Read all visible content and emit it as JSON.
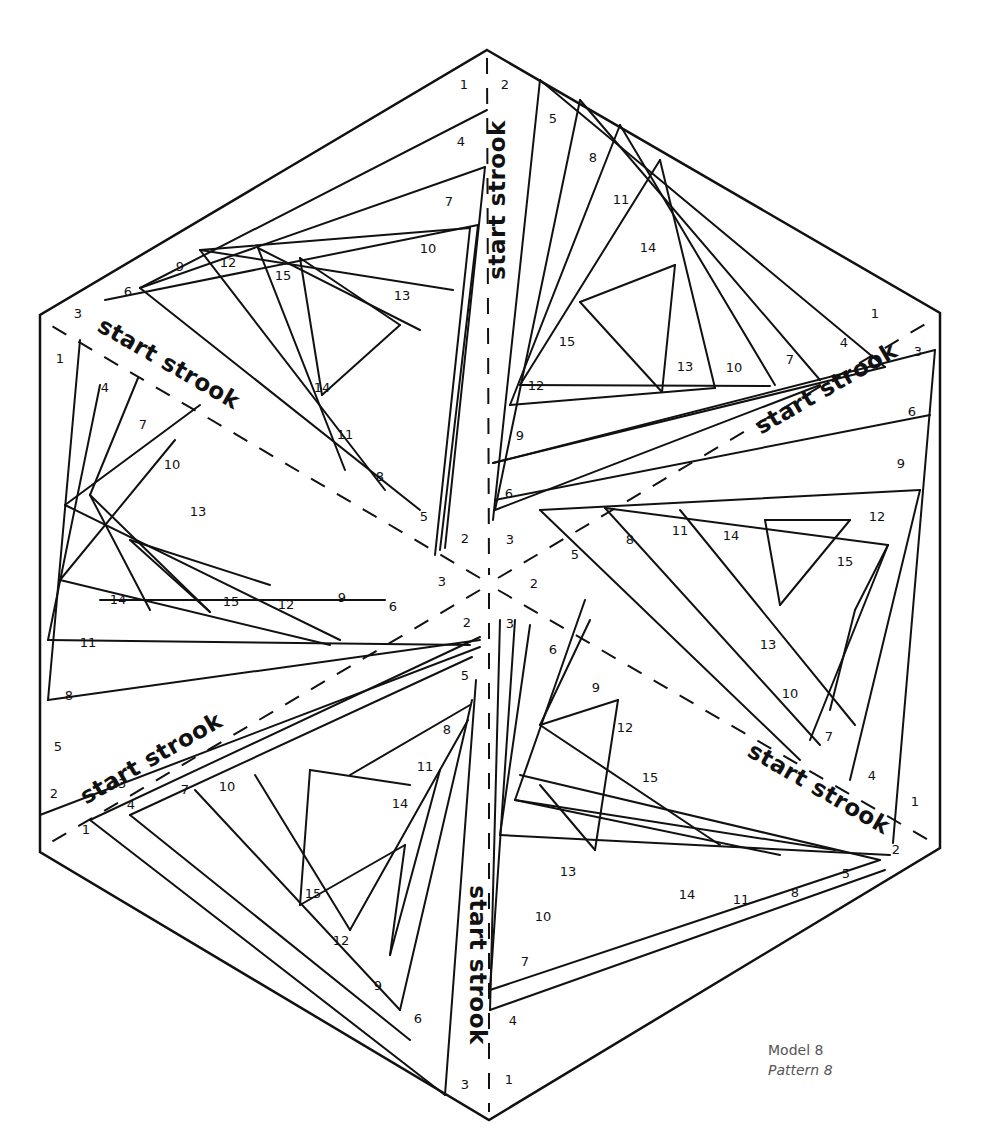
{
  "caption": {
    "model": "Model 8",
    "pattern": "Pattern 8"
  },
  "colors": {
    "line": "#111111",
    "caption": "#555555",
    "background": "#ffffff"
  },
  "hexagon": [
    [
      487,
      50
    ],
    [
      940,
      313
    ],
    [
      940,
      848
    ],
    [
      489,
      1120
    ],
    [
      40,
      852
    ],
    [
      40,
      315
    ]
  ],
  "center": [
    489,
    584
  ],
  "dividers": [
    [
      [
        487,
        58
      ],
      [
        489,
        575
      ]
    ],
    [
      [
        489,
        593
      ],
      [
        489,
        1112
      ]
    ],
    [
      [
        480,
        578
      ],
      [
        50,
        325
      ]
    ],
    [
      [
        498,
        578
      ],
      [
        932,
        320
      ]
    ],
    [
      [
        480,
        590
      ],
      [
        48,
        844
      ]
    ],
    [
      [
        498,
        590
      ],
      [
        932,
        842
      ]
    ]
  ],
  "strips": [
    {
      "label": "start strook",
      "x": 505,
      "y": 200,
      "rotate": -90
    },
    {
      "label": "start strook",
      "x": 165,
      "y": 370,
      "rotate": 30
    },
    {
      "label": "start strook",
      "x": 830,
      "y": 395,
      "rotate": -30
    },
    {
      "label": "start strook",
      "x": 155,
      "y": 765,
      "rotate": -30
    },
    {
      "label": "start strook",
      "x": 815,
      "y": 795,
      "rotate": 30
    },
    {
      "label": "start strook",
      "x": 470,
      "y": 965,
      "rotate": 90
    }
  ],
  "lines": [
    [
      [
        140,
        288
      ],
      [
        487,
        110
      ]
    ],
    [
      [
        140,
        288
      ],
      [
        485,
        167
      ]
    ],
    [
      [
        105,
        300
      ],
      [
        478,
        225
      ]
    ],
    [
      [
        200,
        250
      ],
      [
        470,
        228
      ]
    ],
    [
      [
        200,
        250
      ],
      [
        453,
        290
      ]
    ],
    [
      [
        258,
        248
      ],
      [
        420,
        330
      ]
    ],
    [
      [
        300,
        258
      ],
      [
        400,
        325
      ]
    ],
    [
      [
        300,
        258
      ],
      [
        322,
        395
      ]
    ],
    [
      [
        322,
        395
      ],
      [
        400,
        325
      ]
    ],
    [
      [
        258,
        248
      ],
      [
        345,
        470
      ]
    ],
    [
      [
        200,
        250
      ],
      [
        385,
        490
      ]
    ],
    [
      [
        140,
        288
      ],
      [
        420,
        510
      ]
    ],
    [
      [
        470,
        228
      ],
      [
        435,
        555
      ]
    ],
    [
      [
        478,
        225
      ],
      [
        440,
        550
      ]
    ],
    [
      [
        485,
        167
      ],
      [
        445,
        548
      ]
    ],
    [
      [
        540,
        80
      ],
      [
        493,
        520
      ]
    ],
    [
      [
        580,
        100
      ],
      [
        495,
        510
      ]
    ],
    [
      [
        620,
        125
      ],
      [
        510,
        405
      ]
    ],
    [
      [
        660,
        160
      ],
      [
        520,
        385
      ]
    ],
    [
      [
        660,
        160
      ],
      [
        715,
        388
      ]
    ],
    [
      [
        620,
        125
      ],
      [
        775,
        385
      ]
    ],
    [
      [
        580,
        100
      ],
      [
        820,
        380
      ]
    ],
    [
      [
        540,
        80
      ],
      [
        885,
        367
      ]
    ],
    [
      [
        675,
        265
      ],
      [
        580,
        302
      ]
    ],
    [
      [
        675,
        265
      ],
      [
        662,
        392
      ]
    ],
    [
      [
        580,
        302
      ],
      [
        662,
        392
      ]
    ],
    [
      [
        510,
        405
      ],
      [
        715,
        388
      ]
    ],
    [
      [
        520,
        385
      ],
      [
        770,
        386
      ]
    ],
    [
      [
        495,
        510
      ],
      [
        820,
        385
      ]
    ],
    [
      [
        493,
        463
      ],
      [
        885,
        367
      ]
    ],
    [
      [
        935,
        350
      ],
      [
        493,
        463
      ]
    ],
    [
      [
        930,
        415
      ],
      [
        495,
        500
      ]
    ],
    [
      [
        920,
        490
      ],
      [
        540,
        510
      ]
    ],
    [
      [
        888,
        545
      ],
      [
        605,
        508
      ]
    ],
    [
      [
        888,
        545
      ],
      [
        855,
        610
      ]
    ],
    [
      [
        850,
        520
      ],
      [
        780,
        605
      ]
    ],
    [
      [
        850,
        520
      ],
      [
        765,
        520
      ]
    ],
    [
      [
        765,
        520
      ],
      [
        780,
        605
      ]
    ],
    [
      [
        855,
        610
      ],
      [
        830,
        710
      ]
    ],
    [
      [
        888,
        545
      ],
      [
        810,
        740
      ]
    ],
    [
      [
        920,
        490
      ],
      [
        850,
        780
      ]
    ],
    [
      [
        935,
        350
      ],
      [
        893,
        843
      ]
    ],
    [
      [
        540,
        510
      ],
      [
        800,
        760
      ]
    ],
    [
      [
        605,
        508
      ],
      [
        820,
        745
      ]
    ],
    [
      [
        680,
        510
      ],
      [
        855,
        725
      ]
    ],
    [
      [
        40,
        815
      ],
      [
        480,
        647
      ]
    ],
    [
      [
        48,
        700
      ],
      [
        480,
        640
      ]
    ],
    [
      [
        48,
        640
      ],
      [
        470,
        645
      ]
    ],
    [
      [
        65,
        505
      ],
      [
        340,
        640
      ]
    ],
    [
      [
        60,
        580
      ],
      [
        330,
        645
      ]
    ],
    [
      [
        90,
        495
      ],
      [
        150,
        610
      ]
    ],
    [
      [
        90,
        495
      ],
      [
        210,
        612
      ]
    ],
    [
      [
        130,
        540
      ],
      [
        210,
        612
      ]
    ],
    [
      [
        130,
        540
      ],
      [
        270,
        585
      ]
    ],
    [
      [
        100,
        600
      ],
      [
        385,
        600
      ]
    ],
    [
      [
        90,
        495
      ],
      [
        138,
        378
      ]
    ],
    [
      [
        48,
        640
      ],
      [
        100,
        385
      ]
    ],
    [
      [
        48,
        700
      ],
      [
        80,
        340
      ]
    ],
    [
      [
        65,
        505
      ],
      [
        200,
        405
      ]
    ],
    [
      [
        60,
        580
      ],
      [
        175,
        440
      ]
    ],
    [
      [
        90,
        820
      ],
      [
        480,
        637
      ]
    ],
    [
      [
        90,
        820
      ],
      [
        445,
        1095
      ]
    ],
    [
      [
        130,
        815
      ],
      [
        472,
        657
      ]
    ],
    [
      [
        130,
        815
      ],
      [
        410,
        1040
      ]
    ],
    [
      [
        195,
        790
      ],
      [
        400,
        1010
      ]
    ],
    [
      [
        255,
        775
      ],
      [
        350,
        930
      ]
    ],
    [
      [
        310,
        770
      ],
      [
        410,
        785
      ]
    ],
    [
      [
        310,
        770
      ],
      [
        300,
        905
      ]
    ],
    [
      [
        300,
        905
      ],
      [
        405,
        845
      ]
    ],
    [
      [
        405,
        845
      ],
      [
        390,
        955
      ]
    ],
    [
      [
        440,
        770
      ],
      [
        390,
        955
      ]
    ],
    [
      [
        468,
        720
      ],
      [
        350,
        930
      ]
    ],
    [
      [
        472,
        700
      ],
      [
        400,
        1010
      ]
    ],
    [
      [
        476,
        680
      ],
      [
        445,
        1095
      ]
    ],
    [
      [
        350,
        775
      ],
      [
        470,
        705
      ]
    ],
    [
      [
        490,
        1010
      ],
      [
        885,
        870
      ]
    ],
    [
      [
        490,
        990
      ],
      [
        880,
        860
      ]
    ],
    [
      [
        500,
        835
      ],
      [
        890,
        855
      ]
    ],
    [
      [
        515,
        800
      ],
      [
        835,
        850
      ]
    ],
    [
      [
        515,
        800
      ],
      [
        780,
        855
      ]
    ],
    [
      [
        540,
        725
      ],
      [
        720,
        845
      ]
    ],
    [
      [
        540,
        725
      ],
      [
        618,
        700
      ]
    ],
    [
      [
        618,
        700
      ],
      [
        595,
        850
      ]
    ],
    [
      [
        540,
        785
      ],
      [
        595,
        850
      ]
    ],
    [
      [
        520,
        775
      ],
      [
        880,
        860
      ]
    ],
    [
      [
        590,
        620
      ],
      [
        540,
        725
      ]
    ],
    [
      [
        585,
        600
      ],
      [
        515,
        800
      ]
    ],
    [
      [
        530,
        625
      ],
      [
        500,
        835
      ]
    ],
    [
      [
        515,
        620
      ],
      [
        490,
        990
      ]
    ],
    [
      [
        500,
        620
      ],
      [
        490,
        1010
      ]
    ]
  ],
  "numbers": [
    {
      "t": "1",
      "x": 464,
      "y": 89
    },
    {
      "t": "4",
      "x": 461,
      "y": 146
    },
    {
      "t": "7",
      "x": 449,
      "y": 206
    },
    {
      "t": "10",
      "x": 428,
      "y": 253
    },
    {
      "t": "13",
      "x": 402,
      "y": 300
    },
    {
      "t": "15",
      "x": 283,
      "y": 280
    },
    {
      "t": "12",
      "x": 228,
      "y": 267
    },
    {
      "t": "9",
      "x": 180,
      "y": 271
    },
    {
      "t": "6",
      "x": 128,
      "y": 296
    },
    {
      "t": "3",
      "x": 78,
      "y": 318
    },
    {
      "t": "14",
      "x": 322,
      "y": 392
    },
    {
      "t": "11",
      "x": 345,
      "y": 439
    },
    {
      "t": "8",
      "x": 380,
      "y": 481
    },
    {
      "t": "5",
      "x": 424,
      "y": 521
    },
    {
      "t": "2",
      "x": 465,
      "y": 543
    },
    {
      "t": "1",
      "x": 60,
      "y": 363
    },
    {
      "t": "4",
      "x": 105,
      "y": 392
    },
    {
      "t": "7",
      "x": 143,
      "y": 429
    },
    {
      "t": "10",
      "x": 172,
      "y": 469
    },
    {
      "t": "13",
      "x": 198,
      "y": 516
    },
    {
      "t": "14",
      "x": 118,
      "y": 604
    },
    {
      "t": "11",
      "x": 88,
      "y": 647
    },
    {
      "t": "8",
      "x": 69,
      "y": 700
    },
    {
      "t": "5",
      "x": 58,
      "y": 751
    },
    {
      "t": "2",
      "x": 54,
      "y": 798
    },
    {
      "t": "15",
      "x": 231,
      "y": 606
    },
    {
      "t": "12",
      "x": 286,
      "y": 609
    },
    {
      "t": "9",
      "x": 342,
      "y": 602
    },
    {
      "t": "6",
      "x": 393,
      "y": 611
    },
    {
      "t": "3",
      "x": 442,
      "y": 586
    },
    {
      "t": "2",
      "x": 505,
      "y": 89
    },
    {
      "t": "5",
      "x": 553,
      "y": 123
    },
    {
      "t": "8",
      "x": 593,
      "y": 162
    },
    {
      "t": "11",
      "x": 621,
      "y": 204
    },
    {
      "t": "14",
      "x": 648,
      "y": 252
    },
    {
      "t": "15",
      "x": 567,
      "y": 346
    },
    {
      "t": "12",
      "x": 536,
      "y": 390
    },
    {
      "t": "9",
      "x": 520,
      "y": 440
    },
    {
      "t": "6",
      "x": 509,
      "y": 498
    },
    {
      "t": "3",
      "x": 510,
      "y": 544
    },
    {
      "t": "13",
      "x": 685,
      "y": 371
    },
    {
      "t": "10",
      "x": 734,
      "y": 372
    },
    {
      "t": "7",
      "x": 790,
      "y": 364
    },
    {
      "t": "4",
      "x": 844,
      "y": 347
    },
    {
      "t": "1",
      "x": 875,
      "y": 318
    },
    {
      "t": "3",
      "x": 918,
      "y": 356
    },
    {
      "t": "6",
      "x": 912,
      "y": 416
    },
    {
      "t": "9",
      "x": 901,
      "y": 468
    },
    {
      "t": "12",
      "x": 877,
      "y": 521
    },
    {
      "t": "15",
      "x": 845,
      "y": 566
    },
    {
      "t": "14",
      "x": 731,
      "y": 540
    },
    {
      "t": "11",
      "x": 680,
      "y": 535
    },
    {
      "t": "8",
      "x": 630,
      "y": 544
    },
    {
      "t": "5",
      "x": 575,
      "y": 559
    },
    {
      "t": "2",
      "x": 534,
      "y": 588
    },
    {
      "t": "13",
      "x": 768,
      "y": 649
    },
    {
      "t": "10",
      "x": 790,
      "y": 698
    },
    {
      "t": "7",
      "x": 829,
      "y": 741
    },
    {
      "t": "4",
      "x": 872,
      "y": 780
    },
    {
      "t": "1",
      "x": 915,
      "y": 806
    },
    {
      "t": "2",
      "x": 896,
      "y": 854
    },
    {
      "t": "5",
      "x": 846,
      "y": 878
    },
    {
      "t": "8",
      "x": 795,
      "y": 897
    },
    {
      "t": "11",
      "x": 741,
      "y": 904
    },
    {
      "t": "14",
      "x": 687,
      "y": 899
    },
    {
      "t": "13",
      "x": 568,
      "y": 876
    },
    {
      "t": "10",
      "x": 543,
      "y": 921
    },
    {
      "t": "7",
      "x": 525,
      "y": 966
    },
    {
      "t": "4",
      "x": 513,
      "y": 1025
    },
    {
      "t": "1",
      "x": 509,
      "y": 1084
    },
    {
      "t": "3",
      "x": 465,
      "y": 1089
    },
    {
      "t": "6",
      "x": 418,
      "y": 1023
    },
    {
      "t": "9",
      "x": 378,
      "y": 990
    },
    {
      "t": "12",
      "x": 341,
      "y": 945
    },
    {
      "t": "15",
      "x": 313,
      "y": 898
    },
    {
      "t": "14",
      "x": 400,
      "y": 808
    },
    {
      "t": "11",
      "x": 425,
      "y": 771
    },
    {
      "t": "8",
      "x": 447,
      "y": 734
    },
    {
      "t": "5",
      "x": 465,
      "y": 680
    },
    {
      "t": "2",
      "x": 467,
      "y": 627
    },
    {
      "t": "3",
      "x": 510,
      "y": 628
    },
    {
      "t": "6",
      "x": 553,
      "y": 654
    },
    {
      "t": "9",
      "x": 596,
      "y": 692
    },
    {
      "t": "12",
      "x": 625,
      "y": 732
    },
    {
      "t": "15",
      "x": 650,
      "y": 782
    },
    {
      "t": "13",
      "x": 118,
      "y": 788
    },
    {
      "t": "10",
      "x": 227,
      "y": 791
    },
    {
      "t": "7",
      "x": 185,
      "y": 794
    },
    {
      "t": "4",
      "x": 131,
      "y": 809
    },
    {
      "t": "1",
      "x": 86,
      "y": 834
    }
  ]
}
